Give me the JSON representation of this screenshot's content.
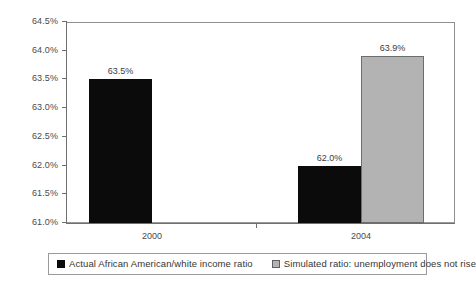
{
  "chart_data": {
    "type": "bar",
    "title": "",
    "subtitle": "",
    "xlabel": "",
    "ylabel": "",
    "categories": [
      "2000",
      "2004"
    ],
    "series": [
      {
        "name": "Actual African American/white income ratio",
        "color": "#0b0b0b",
        "values": [
          63.5,
          62.0
        ],
        "labels": [
          "63.5%",
          "62.0%"
        ]
      },
      {
        "name": "Simulated ratio: unemployment does not rise",
        "color": "#b3b3b3",
        "values": [
          null,
          63.9
        ],
        "labels": [
          null,
          "63.9%"
        ]
      }
    ],
    "ylim": [
      61.0,
      64.5
    ],
    "ytick_values": [
      64.5,
      64.0,
      63.5,
      63.0,
      62.5,
      62.0,
      61.5,
      61.0
    ],
    "ytick_labels": [
      "64.5%",
      "64.0%",
      "63.5%",
      "63.0%",
      "62.5%",
      "62.0%",
      "61.5%",
      "61.0%"
    ],
    "grid": false,
    "legend_position": "bottom",
    "bar_value_labels": true
  },
  "legend": {
    "entries": [
      {
        "label": "Actual African American/white income ratio",
        "swatch": "black-square-swatch"
      },
      {
        "label": "Simulated ratio: unemployment does not rise",
        "swatch": "gray-square-swatch"
      }
    ]
  }
}
